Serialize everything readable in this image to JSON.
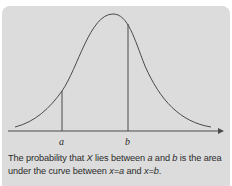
{
  "figure": {
    "type": "normal-distribution-curve",
    "background_color": "#dcdcdc",
    "line_color": "#4a4a4a",
    "axis": {
      "arrow": true
    },
    "markers": [
      {
        "label": "a",
        "x_px": 62
      },
      {
        "label": "b",
        "x_px": 128
      }
    ]
  },
  "caption": {
    "line1_part1": "The probability that ",
    "var_x": "X",
    "line1_part2": " lies between ",
    "a": "a",
    "and1": " and ",
    "b": "b",
    "line1_part3": " is the area",
    "line2_part1": "under the curve between ",
    "x_eq_a": "x=a",
    "and2": " and ",
    "x_eq_b": "x=b",
    "end": "."
  }
}
